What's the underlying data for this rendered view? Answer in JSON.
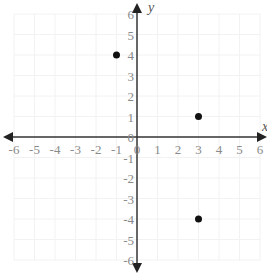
{
  "chart_data": {
    "type": "scatter",
    "title": "",
    "xlabel": "x",
    "ylabel": "y",
    "xlim": [
      -6,
      6
    ],
    "ylim": [
      -6,
      6
    ],
    "x_ticks": [
      -6,
      -5,
      -4,
      -3,
      -2,
      -1,
      0,
      1,
      2,
      3,
      4,
      5,
      6
    ],
    "y_ticks": [
      -6,
      -5,
      -4,
      -3,
      -2,
      -1,
      0,
      1,
      2,
      3,
      4,
      5,
      6
    ],
    "grid": true,
    "legend": null,
    "points": [
      {
        "x": -1,
        "y": 4
      },
      {
        "x": 3,
        "y": 1
      },
      {
        "x": 3,
        "y": -4
      }
    ]
  },
  "colors": {
    "axis": "#333333",
    "tick_label": "#8a8a8a",
    "point": "#111111",
    "grid": "#f2f2f2"
  }
}
